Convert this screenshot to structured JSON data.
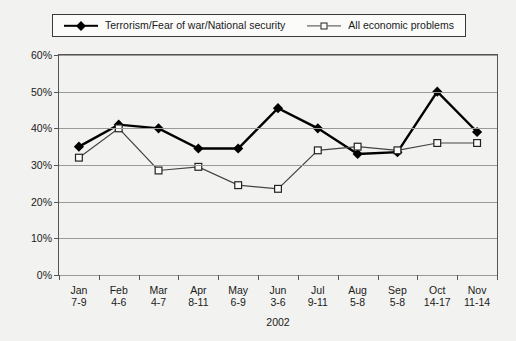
{
  "legend": {
    "position": "top",
    "entries": [
      {
        "label": "Terrorism/Fear of war/National security",
        "marker": "filled-diamond",
        "color": "#000000"
      },
      {
        "label": "All economic problems",
        "marker": "open-square",
        "color": "#444444"
      }
    ]
  },
  "axis": {
    "x_title": "2002",
    "y_ticks": [
      "0%",
      "10%",
      "20%",
      "30%",
      "40%",
      "50%",
      "60%"
    ]
  },
  "chart_data": {
    "type": "line",
    "title": "",
    "xlabel": "2002",
    "ylabel": "",
    "ylim": [
      0,
      60
    ],
    "ytick_values": [
      0,
      10,
      20,
      30,
      40,
      50,
      60
    ],
    "grid": true,
    "legend_position": "top",
    "categories": [
      "Jan\n7-9",
      "Feb\n4-6",
      "Mar\n4-7",
      "Apr\n8-11",
      "May\n6-9",
      "Jun\n3-6",
      "Jul\n9-11",
      "Aug\n5-8",
      "Sep\n5-8",
      "Oct\n14-17",
      "Nov\n11-14"
    ],
    "category_lines": [
      [
        "Jan",
        "7-9"
      ],
      [
        "Feb",
        "4-6"
      ],
      [
        "Mar",
        "4-7"
      ],
      [
        "Apr",
        "8-11"
      ],
      [
        "May",
        "6-9"
      ],
      [
        "Jun",
        "3-6"
      ],
      [
        "Jul",
        "9-11"
      ],
      [
        "Aug",
        "5-8"
      ],
      [
        "Sep",
        "5-8"
      ],
      [
        "Oct",
        "14-17"
      ],
      [
        "Nov",
        "11-14"
      ]
    ],
    "series": [
      {
        "name": "Terrorism/Fear of war/National security",
        "marker": "filled-diamond",
        "color": "#000000",
        "values": [
          35,
          41,
          40,
          34.5,
          34.5,
          45.5,
          40,
          33,
          33.5,
          50,
          39
        ]
      },
      {
        "name": "All economic problems",
        "marker": "open-square",
        "color": "#444444",
        "values": [
          32,
          40,
          28.5,
          29.5,
          24.5,
          23.5,
          34,
          35,
          34,
          36,
          36
        ]
      }
    ]
  }
}
